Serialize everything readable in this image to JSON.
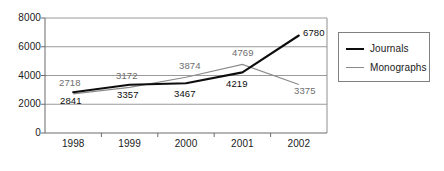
{
  "chart_data": {
    "type": "line",
    "title": "",
    "subtitle": "",
    "xlabel": "",
    "ylabel": "",
    "categories": [
      "1998",
      "1999",
      "2000",
      "2001",
      "2002"
    ],
    "series": [
      {
        "name": "Journals",
        "color": "#0d0d0d",
        "values": [
          2841,
          3357,
          3467,
          4219,
          6780
        ],
        "point_labels": [
          "2841",
          "3357",
          "3467",
          "4219",
          "6780"
        ]
      },
      {
        "name": "Monographs",
        "color": "#8a8a8a",
        "values": [
          2718,
          3172,
          3874,
          4769,
          3375
        ],
        "point_labels": [
          "2718",
          "3172",
          "3874",
          "4769",
          "3375"
        ]
      }
    ],
    "ylim": [
      0,
      8000
    ],
    "yticks": [
      0,
      2000,
      4000,
      6000,
      8000
    ],
    "ytick_labels": [
      "0",
      "2000",
      "4000",
      "6000",
      "8000"
    ],
    "grid": true,
    "gridlines_at": [
      2000,
      4000,
      6000
    ],
    "legend_position": "right"
  },
  "axes": {
    "y_ticks": [
      {
        "label": "8000",
        "value": 8000
      },
      {
        "label": "6000",
        "value": 6000
      },
      {
        "label": "4000",
        "value": 4000
      },
      {
        "label": "2000",
        "value": 2000
      },
      {
        "label": "0",
        "value": 0
      }
    ],
    "x_ticks": [
      {
        "label": "1998"
      },
      {
        "label": "1999"
      },
      {
        "label": "2000"
      },
      {
        "label": "2001"
      },
      {
        "label": "2002"
      }
    ]
  },
  "legend": {
    "entries": [
      {
        "label": "Journals",
        "marker": "thick-black-line"
      },
      {
        "label": "Monographs",
        "marker": "thin-gray-line"
      }
    ]
  },
  "data_labels": {
    "journals": [
      "2841",
      "3357",
      "3467",
      "4219",
      "6780"
    ],
    "monographs": [
      "2718",
      "3172",
      "3874",
      "4769",
      "3375"
    ]
  },
  "colors": {
    "journals_line": "#0d0d0d",
    "monographs_line": "#8a8a8a",
    "gridline": "#9a9a9a",
    "axis": "#6b6b6b",
    "legend_border": "#808080",
    "background": "#ffffff"
  }
}
